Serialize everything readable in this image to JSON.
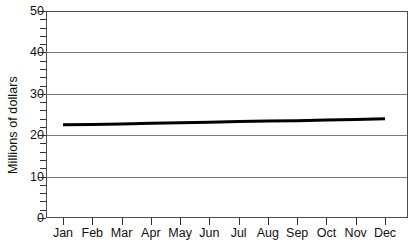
{
  "chart_data": {
    "type": "line",
    "title": "",
    "xlabel": "",
    "ylabel": "Millions of dollars",
    "categories": [
      "Jan",
      "Feb",
      "Mar",
      "Apr",
      "May",
      "Jun",
      "Jul",
      "Aug",
      "Sep",
      "Oct",
      "Nov",
      "Dec"
    ],
    "series": [
      {
        "name": "",
        "values": [
          22.5,
          22.6,
          22.7,
          22.9,
          23.0,
          23.1,
          23.3,
          23.4,
          23.5,
          23.7,
          23.8,
          24.0
        ],
        "color": "#000000",
        "line_width": 3
      }
    ],
    "ylim": [
      0,
      50
    ],
    "y_major_ticks": [
      0,
      10,
      20,
      30,
      40,
      50
    ],
    "y_minor_tick_step": 2,
    "y_tick_labels": [
      "0",
      "10",
      "20",
      "30",
      "40",
      "50"
    ],
    "grid": {
      "horizontal": true,
      "vertical": false,
      "color": "#7a7a7a"
    },
    "legend": {
      "visible": false,
      "position": "none"
    },
    "frame": {
      "visible": true,
      "color": "#4d4d4d"
    },
    "background_color": "#ffffff"
  }
}
